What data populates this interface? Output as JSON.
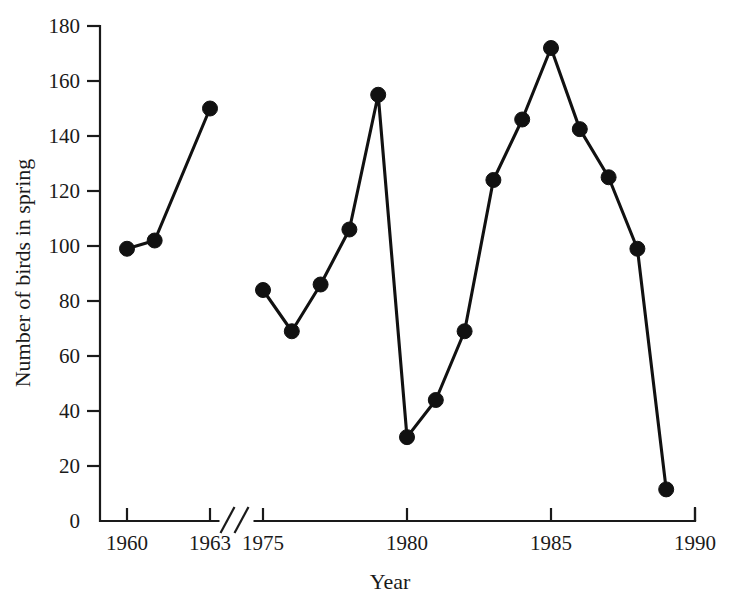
{
  "chart_data": {
    "type": "line",
    "title": "",
    "xlabel": "Year",
    "ylabel": "Number of birds in spring",
    "xlim": [
      1959,
      1990
    ],
    "ylim": [
      0,
      180
    ],
    "grid": false,
    "legend": "none",
    "axis_break": {
      "present": true,
      "between": [
        1963,
        1975
      ],
      "style": "double-slash"
    },
    "xticks": [
      1960,
      1963,
      1975,
      1980,
      1985,
      1990
    ],
    "xtick_labels": [
      "1960",
      "1963",
      "1975",
      "1980",
      "1985",
      "1990"
    ],
    "yticks": [
      0,
      20,
      40,
      60,
      80,
      100,
      120,
      140,
      160,
      180
    ],
    "ytick_labels": [
      "0",
      "20",
      "40",
      "60",
      "80",
      "100",
      "120",
      "140",
      "160",
      "180"
    ],
    "series": [
      {
        "name": "early-segment",
        "x": [
          1960,
          1961,
          1963
        ],
        "values": [
          99,
          102,
          150
        ]
      },
      {
        "name": "late-segment",
        "x": [
          1975,
          1976,
          1977,
          1978,
          1979,
          1980,
          1981,
          1982,
          1983,
          1984,
          1985,
          1986,
          1987,
          1988,
          1989
        ],
        "values": [
          84,
          69,
          86,
          106,
          155,
          30.5,
          44,
          69,
          124,
          146,
          172,
          142.5,
          125,
          99,
          11.5
        ]
      }
    ],
    "marker": "filled-circle",
    "marker_size": 9,
    "line_color": "#111111"
  },
  "figure": {
    "background_color": "#ffffff",
    "ink_color": "#1a1a1a"
  }
}
